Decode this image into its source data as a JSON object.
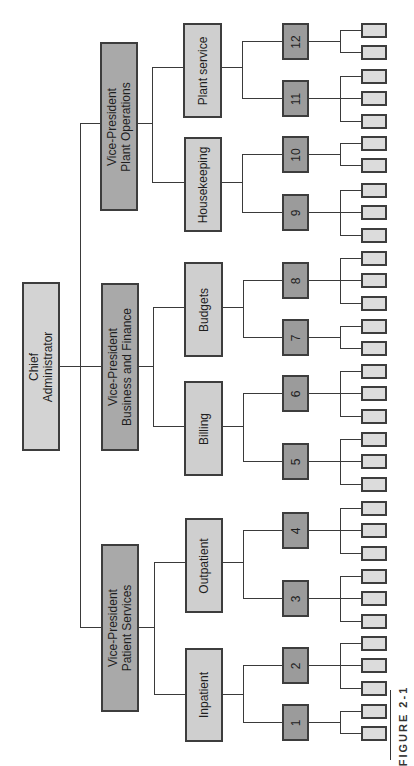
{
  "figure_label": "FIGURE 2-1",
  "colors": {
    "chief_fill": "#d3d3d3",
    "vp_fill": "#a9a9a9",
    "dept_fill": "#cfcfcf",
    "unit_fill": "#9b9b9b",
    "leaf_fill": "#dcdcdc",
    "border": "#3d3d3d",
    "line": "#3a3a3a"
  },
  "orientation": "rotated-90-ccw",
  "root": {
    "label": "Chief\nAdministrator",
    "children": [
      {
        "label": "Vice-President\nPlant Operations",
        "children": [
          {
            "label": "Plant service",
            "units": [
              {
                "number": "12",
                "leaves": 2
              },
              {
                "number": "11",
                "leaves": 3
              }
            ]
          },
          {
            "label": "Housekeeping",
            "units": [
              {
                "number": "10",
                "leaves": 2
              },
              {
                "number": "9",
                "leaves": 3
              }
            ]
          }
        ]
      },
      {
        "label": "Vice-President\nBusiness and Finance",
        "children": [
          {
            "label": "Budgets",
            "units": [
              {
                "number": "8",
                "leaves": 3
              },
              {
                "number": "7",
                "leaves": 2
              }
            ]
          },
          {
            "label": "Billing",
            "units": [
              {
                "number": "6",
                "leaves": 3
              },
              {
                "number": "5",
                "leaves": 3
              }
            ]
          }
        ]
      },
      {
        "label": "Vice-President\nPatient Services",
        "children": [
          {
            "label": "Outpatient",
            "units": [
              {
                "number": "4",
                "leaves": 3
              },
              {
                "number": "3",
                "leaves": 3
              }
            ]
          },
          {
            "label": "Inpatient",
            "units": [
              {
                "number": "2",
                "leaves": 3
              },
              {
                "number": "1",
                "leaves": 2
              }
            ]
          }
        ]
      }
    ]
  }
}
